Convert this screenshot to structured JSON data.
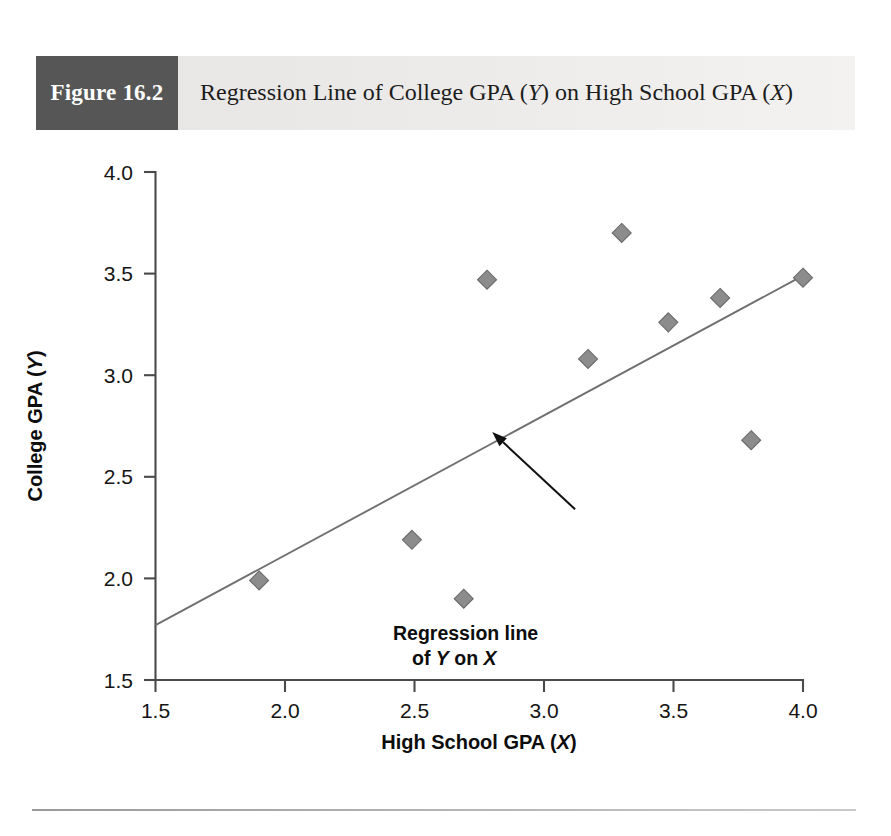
{
  "figure": {
    "number_label": "Figure 16.2",
    "title_line1_pre": "Regression Line of College GPA (",
    "title_italic1": "Y",
    "title_line1_post": ") on High School",
    "title_line2_pre": "GPA (",
    "title_italic2": "X",
    "title_line2_post": ")",
    "title_full": "Regression Line of College GPA (Y) on High School GPA (X)"
  },
  "chart_data": {
    "type": "scatter",
    "title": "Regression Line of College GPA (Y) on High School GPA (X)",
    "xlabel": "High School GPA (X)",
    "ylabel": "College GPA (Y)",
    "xlabel_pre": "High School GPA (",
    "xlabel_italic": "X",
    "xlabel_post": ")",
    "ylabel_pre": "College GPA (",
    "ylabel_italic": "Y",
    "ylabel_post": ")",
    "xlim": [
      1.5,
      4.0
    ],
    "ylim": [
      1.5,
      4.0
    ],
    "xticks": [
      1.5,
      2.0,
      2.5,
      3.0,
      3.5,
      4.0
    ],
    "yticks": [
      1.5,
      2.0,
      2.5,
      3.0,
      3.5,
      4.0
    ],
    "xtick_labels": [
      "1.5",
      "2.0",
      "2.5",
      "3.0",
      "3.5",
      "4.0"
    ],
    "ytick_labels": [
      "1.5",
      "2.0",
      "2.5",
      "3.0",
      "3.5",
      "4.0"
    ],
    "grid": false,
    "legend": false,
    "marker": "diamond",
    "marker_color": "#8c8c8c",
    "points": [
      {
        "x": 1.9,
        "y": 1.99
      },
      {
        "x": 2.49,
        "y": 2.19
      },
      {
        "x": 2.69,
        "y": 1.9
      },
      {
        "x": 2.78,
        "y": 3.47
      },
      {
        "x": 3.17,
        "y": 3.08
      },
      {
        "x": 3.3,
        "y": 3.7
      },
      {
        "x": 3.48,
        "y": 3.26
      },
      {
        "x": 3.68,
        "y": 3.38
      },
      {
        "x": 3.8,
        "y": 2.68
      },
      {
        "x": 4.0,
        "y": 3.48
      }
    ],
    "fit_line": {
      "x0": 1.5,
      "y0": 1.77,
      "x1": 4.0,
      "y1": 3.49,
      "color": "#6f6f6f"
    },
    "annotation": {
      "line1": "Regression line",
      "line2_pre": "of ",
      "line2_italic1": "Y",
      "line2_mid": " on ",
      "line2_italic2": "X",
      "text_full": "Regression line of Y on X",
      "arrow_from": {
        "x": 3.12,
        "y": 2.34
      },
      "arrow_to": {
        "x": 2.8,
        "y": 2.72
      }
    }
  },
  "colors": {
    "figure_box": "#565656",
    "banner_start": "#e6e5e3",
    "banner_end": "#f3f2f0",
    "axis": "#4a4a4a",
    "marker": "#8c8c8c",
    "line": "#6f6f6f",
    "rule": "#b4b4b4"
  }
}
